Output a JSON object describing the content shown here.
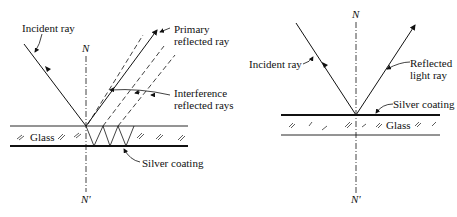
{
  "left_diagram": {
    "normal_top_label": "N",
    "normal_bottom_label": "N'",
    "incident_label": "Incident ray",
    "primary_label_line1": "Primary",
    "primary_label_line2": "reflected ray",
    "interference_label_line1": "Interference",
    "interference_label_line2": "reflected rays",
    "glass_label": "Glass",
    "silver_label": "Silver coating"
  },
  "right_diagram": {
    "normal_top_label": "N",
    "normal_bottom_label": "N'",
    "incident_label": "Incident ray",
    "reflected_label_line1": "Reflected",
    "reflected_label_line2": "light ray",
    "glass_label": "Glass",
    "silver_label": "Silver coating"
  },
  "colors": {
    "ink": "#111111",
    "background": "#ffffff"
  }
}
